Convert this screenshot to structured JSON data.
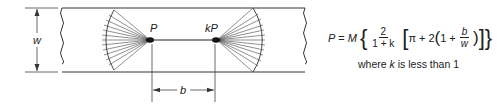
{
  "diagram": {
    "labels": {
      "width": "w",
      "left_load": "P",
      "right_load": "kP",
      "spacing": "b"
    }
  },
  "formula": {
    "lhs": "P",
    "equals": "=",
    "coef": "M",
    "open_brace": "{",
    "frac1_num": "2",
    "frac1_den": "1 + k",
    "open_bracket": "[",
    "pi": "π",
    "plus1": "+",
    "two": "2",
    "open_paren": "(",
    "one": "1",
    "plus2": "+",
    "frac2_num": "b",
    "frac2_den": "w",
    "close_paren": ")",
    "close_bracket": "]",
    "close_brace": "}"
  },
  "caption": {
    "prefix": "where",
    "var": "k",
    "suffix": "is less than 1"
  }
}
